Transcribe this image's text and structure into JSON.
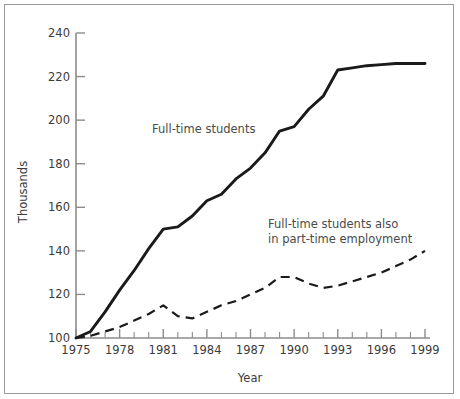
{
  "chart_data": {
    "type": "line",
    "title": "",
    "xlabel": "Year",
    "ylabel": "Thousands",
    "xlim": [
      1975,
      1999
    ],
    "ylim": [
      100,
      240
    ],
    "grid": false,
    "legend_position": "inline-annotations",
    "x_ticks": [
      "1975",
      "1978",
      "1981",
      "1984",
      "1987",
      "1990",
      "1993",
      "1996",
      "1999"
    ],
    "x_tick_values": [
      1975,
      1978,
      1981,
      1984,
      1987,
      1990,
      1993,
      1996,
      1999
    ],
    "x_minor_ticks": [
      1976,
      1977,
      1979,
      1980,
      1982,
      1983,
      1985,
      1986,
      1988,
      1989,
      1991,
      1992,
      1994,
      1995,
      1997,
      1998
    ],
    "y_ticks": [
      "100",
      "120",
      "140",
      "160",
      "180",
      "200",
      "220",
      "240"
    ],
    "y_tick_values": [
      100,
      120,
      140,
      160,
      180,
      200,
      220,
      240
    ],
    "x": [
      1975,
      1976,
      1977,
      1978,
      1979,
      1980,
      1981,
      1982,
      1983,
      1984,
      1985,
      1986,
      1987,
      1988,
      1989,
      1990,
      1991,
      1992,
      1993,
      1994,
      1995,
      1996,
      1997,
      1998,
      1999
    ],
    "series": [
      {
        "name": "Full-time students",
        "style": "solid",
        "color": "#1a1a1a",
        "values": [
          100,
          103,
          112,
          122,
          131,
          141,
          150,
          151,
          156,
          163,
          166,
          173,
          178,
          185,
          195,
          197,
          205,
          211,
          223,
          224,
          225,
          225.5,
          226,
          226,
          226
        ]
      },
      {
        "name": "Full-time students also in part-time employment",
        "style": "dashed",
        "color": "#1a1a1a",
        "values": [
          100,
          101,
          103,
          105,
          108,
          111,
          115,
          110,
          109,
          112,
          115,
          117,
          120,
          123,
          128,
          128,
          125,
          123,
          124,
          126,
          128,
          130,
          133,
          136,
          140
        ]
      }
    ],
    "annotations": [
      {
        "id": "label-full-time",
        "text": "Full-time students",
        "lines": [
          "Full-time students"
        ]
      },
      {
        "id": "label-part-time",
        "text": "Full-time students also in part-time employment",
        "lines": [
          "Full-time students also",
          "in part-time employment"
        ]
      }
    ]
  },
  "axis": {
    "y_title": "Thousands",
    "x_title": "Year"
  },
  "colors": {
    "line": "#1a1a1a",
    "axis": "#8c8c8c",
    "text": "#3b3b3b",
    "border": "#9a9a9a",
    "background": "#ffffff"
  }
}
